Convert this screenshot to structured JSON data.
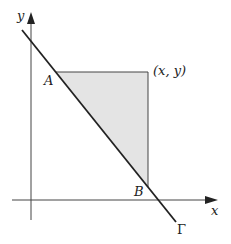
{
  "diagram": {
    "axes": {
      "x_label": "x",
      "y_label": "y"
    },
    "points": {
      "A": "A",
      "B": "B",
      "corner": "(x, y)"
    },
    "curve_label": "Γ",
    "colors": {
      "shade": "#e4e4e4",
      "line": "#222222"
    }
  }
}
